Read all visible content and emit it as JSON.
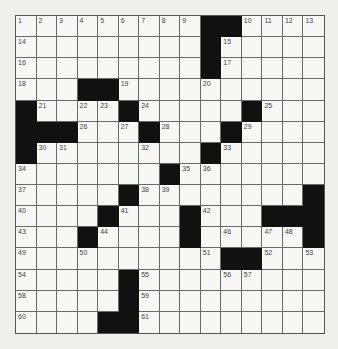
{
  "puzzle": {
    "rows": 15,
    "cols": 15,
    "layout": [
      "#########BB####",
      "#########B#####",
      "#########B#####",
      "###BB##########",
      "B####B#####B###",
      "BBB###B###B####",
      "B########B#####",
      "#######B#######",
      "#####B########B",
      "####B###B###BBB",
      "###B####B#####B",
      "##########BB###",
      "#####B#########",
      "#####B#########",
      "####BB#########"
    ],
    "layout_legend": {
      "#": "white",
      "B": "black"
    },
    "numbers": [
      {
        "n": "1",
        "r": 0,
        "c": 0
      },
      {
        "n": "2",
        "r": 0,
        "c": 1
      },
      {
        "n": "3",
        "r": 0,
        "c": 2
      },
      {
        "n": "4",
        "r": 0,
        "c": 3
      },
      {
        "n": "5",
        "r": 0,
        "c": 4
      },
      {
        "n": "6",
        "r": 0,
        "c": 5
      },
      {
        "n": "7",
        "r": 0,
        "c": 6
      },
      {
        "n": "8",
        "r": 0,
        "c": 7
      },
      {
        "n": "9",
        "r": 0,
        "c": 8
      },
      {
        "n": "10",
        "r": 0,
        "c": 11
      },
      {
        "n": "11",
        "r": 0,
        "c": 12
      },
      {
        "n": "12",
        "r": 0,
        "c": 13
      },
      {
        "n": "13",
        "r": 0,
        "c": 14
      },
      {
        "n": "14",
        "r": 1,
        "c": 0
      },
      {
        "n": "15",
        "r": 1,
        "c": 10
      },
      {
        "n": "16",
        "r": 2,
        "c": 0
      },
      {
        "n": "17",
        "r": 2,
        "c": 10
      },
      {
        "n": "18",
        "r": 3,
        "c": 0
      },
      {
        "n": "19",
        "r": 3,
        "c": 5
      },
      {
        "n": "20",
        "r": 3,
        "c": 9
      },
      {
        "n": "21",
        "r": 4,
        "c": 1
      },
      {
        "n": "22",
        "r": 4,
        "c": 3
      },
      {
        "n": "23",
        "r": 4,
        "c": 4
      },
      {
        "n": "24",
        "r": 4,
        "c": 6
      },
      {
        "n": "25",
        "r": 4,
        "c": 12
      },
      {
        "n": "26",
        "r": 5,
        "c": 3
      },
      {
        "n": "27",
        "r": 5,
        "c": 5
      },
      {
        "n": "28",
        "r": 5,
        "c": 7
      },
      {
        "n": "29",
        "r": 5,
        "c": 11
      },
      {
        "n": "30",
        "r": 6,
        "c": 1
      },
      {
        "n": "31",
        "r": 6,
        "c": 2
      },
      {
        "n": "32",
        "r": 6,
        "c": 6
      },
      {
        "n": "33",
        "r": 6,
        "c": 10
      },
      {
        "n": "34",
        "r": 7,
        "c": 0
      },
      {
        "n": "35",
        "r": 7,
        "c": 8
      },
      {
        "n": "36",
        "r": 7,
        "c": 9
      },
      {
        "n": "37",
        "r": 8,
        "c": 0
      },
      {
        "n": "38",
        "r": 8,
        "c": 6
      },
      {
        "n": "39",
        "r": 8,
        "c": 7
      },
      {
        "n": "40",
        "r": 9,
        "c": 0
      },
      {
        "n": "41",
        "r": 9,
        "c": 5
      },
      {
        "n": "42",
        "r": 9,
        "c": 9
      },
      {
        "n": "43",
        "r": 10,
        "c": 0
      },
      {
        "n": "44",
        "r": 10,
        "c": 4
      },
      {
        "n": "45",
        "r": 10,
        "c": 8
      },
      {
        "n": "46",
        "r": 10,
        "c": 10
      },
      {
        "n": "47",
        "r": 10,
        "c": 12
      },
      {
        "n": "48",
        "r": 10,
        "c": 13
      },
      {
        "n": "49",
        "r": 11,
        "c": 0
      },
      {
        "n": "50",
        "r": 11,
        "c": 3
      },
      {
        "n": "51",
        "r": 11,
        "c": 9
      },
      {
        "n": "52",
        "r": 11,
        "c": 12
      },
      {
        "n": "53",
        "r": 11,
        "c": 14
      },
      {
        "n": "54",
        "r": 12,
        "c": 0
      },
      {
        "n": "55",
        "r": 12,
        "c": 6
      },
      {
        "n": "56",
        "r": 12,
        "c": 10
      },
      {
        "n": "57",
        "r": 12,
        "c": 11
      },
      {
        "n": "58",
        "r": 13,
        "c": 0
      },
      {
        "n": "59",
        "r": 13,
        "c": 6
      },
      {
        "n": "60",
        "r": 14,
        "c": 0
      },
      {
        "n": "61",
        "r": 14,
        "c": 6
      }
    ]
  },
  "colors": {
    "page_bg": "#efefed",
    "cell_bg": "#f7f7f5",
    "block": "#111111",
    "grid_line": "#6a6a6a",
    "number_text": "#444444"
  }
}
